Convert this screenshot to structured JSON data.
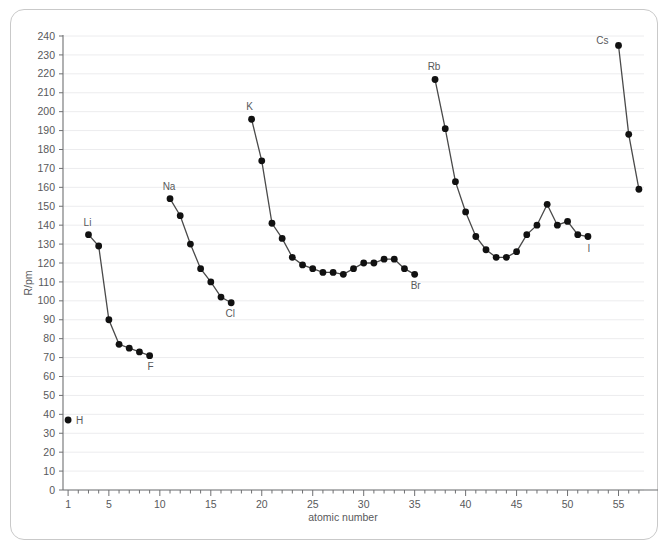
{
  "chart_data": {
    "type": "line",
    "title": "",
    "xlabel": "atomic number",
    "ylabel": "R/pm",
    "xlim": [
      0.5,
      57.5
    ],
    "ylim": [
      0,
      240
    ],
    "ytick_step": 10,
    "grid": true,
    "legend": "none",
    "x_ticks": [
      1,
      5,
      10,
      15,
      20,
      25,
      30,
      35,
      40,
      45,
      50,
      55
    ],
    "x_ticks_minor_every": 1,
    "y_ticks": [
      0,
      10,
      20,
      30,
      40,
      50,
      60,
      70,
      80,
      90,
      100,
      110,
      120,
      130,
      140,
      150,
      160,
      170,
      180,
      190,
      200,
      210,
      220,
      230,
      240
    ],
    "series": [
      {
        "name": "hydrogen",
        "connected": false,
        "points": [
          {
            "x": 1,
            "y": 37
          }
        ]
      },
      {
        "name": "period-2",
        "connected": true,
        "points": [
          {
            "x": 3,
            "y": 135
          },
          {
            "x": 4,
            "y": 129
          },
          {
            "x": 5,
            "y": 90
          },
          {
            "x": 6,
            "y": 77
          },
          {
            "x": 7,
            "y": 75
          },
          {
            "x": 8,
            "y": 73
          },
          {
            "x": 9,
            "y": 71
          }
        ]
      },
      {
        "name": "period-3",
        "connected": true,
        "points": [
          {
            "x": 11,
            "y": 154
          },
          {
            "x": 12,
            "y": 145
          },
          {
            "x": 13,
            "y": 130
          },
          {
            "x": 14,
            "y": 117
          },
          {
            "x": 15,
            "y": 110
          },
          {
            "x": 16,
            "y": 102
          },
          {
            "x": 17,
            "y": 99
          }
        ]
      },
      {
        "name": "period-4",
        "connected": true,
        "points": [
          {
            "x": 19,
            "y": 196
          },
          {
            "x": 20,
            "y": 174
          },
          {
            "x": 21,
            "y": 141
          },
          {
            "x": 22,
            "y": 133
          },
          {
            "x": 23,
            "y": 123
          },
          {
            "x": 24,
            "y": 119
          },
          {
            "x": 25,
            "y": 117
          },
          {
            "x": 26,
            "y": 115
          },
          {
            "x": 27,
            "y": 115
          },
          {
            "x": 28,
            "y": 114
          },
          {
            "x": 29,
            "y": 117
          },
          {
            "x": 30,
            "y": 120
          },
          {
            "x": 31,
            "y": 120
          },
          {
            "x": 32,
            "y": 122
          },
          {
            "x": 33,
            "y": 122
          },
          {
            "x": 34,
            "y": 117
          },
          {
            "x": 35,
            "y": 114
          }
        ]
      },
      {
        "name": "period-5",
        "connected": true,
        "points": [
          {
            "x": 37,
            "y": 217
          },
          {
            "x": 38,
            "y": 191
          },
          {
            "x": 39,
            "y": 163
          },
          {
            "x": 40,
            "y": 147
          },
          {
            "x": 41,
            "y": 134
          },
          {
            "x": 42,
            "y": 127
          },
          {
            "x": 43,
            "y": 123
          },
          {
            "x": 44,
            "y": 123
          },
          {
            "x": 45,
            "y": 126
          },
          {
            "x": 46,
            "y": 135
          },
          {
            "x": 47,
            "y": 140
          },
          {
            "x": 48,
            "y": 151
          },
          {
            "x": 49,
            "y": 140
          },
          {
            "x": 50,
            "y": 142
          },
          {
            "x": 51,
            "y": 135
          },
          {
            "x": 52,
            "y": 134
          }
        ]
      },
      {
        "name": "period-6",
        "connected": true,
        "points": [
          {
            "x": 55,
            "y": 235
          },
          {
            "x": 56,
            "y": 188
          },
          {
            "x": 57,
            "y": 159
          }
        ]
      }
    ],
    "annotations": [
      {
        "label": "H",
        "x": 1,
        "y": 37,
        "dx": 8,
        "dy": 4
      },
      {
        "label": "Li",
        "x": 3,
        "y": 135,
        "dx": -1,
        "dy": -9
      },
      {
        "label": "F",
        "x": 9,
        "y": 71,
        "dx": 1,
        "dy": 14
      },
      {
        "label": "Na",
        "x": 11,
        "y": 154,
        "dx": -1,
        "dy": -9
      },
      {
        "label": "Cl",
        "x": 17,
        "y": 99,
        "dx": -1,
        "dy": 14
      },
      {
        "label": "K",
        "x": 19,
        "y": 196,
        "dx": -2,
        "dy": -9
      },
      {
        "label": "Br",
        "x": 35,
        "y": 114,
        "dx": 1,
        "dy": 15
      },
      {
        "label": "Rb",
        "x": 37,
        "y": 217,
        "dx": -1,
        "dy": -10
      },
      {
        "label": "I",
        "x": 52,
        "y": 134,
        "dx": 1,
        "dy": 15
      },
      {
        "label": "Cs",
        "x": 55,
        "y": 235,
        "dx": -10,
        "dy": -1
      }
    ]
  },
  "axes": {
    "x_axis_title": "atomic number",
    "y_axis_title": "R/pm"
  }
}
